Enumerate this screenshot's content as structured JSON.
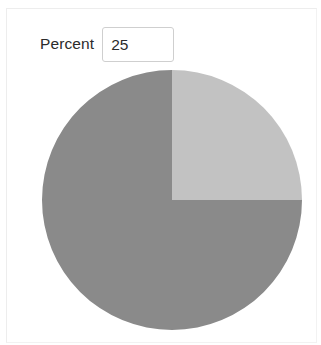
{
  "form": {
    "percent_label": "Percent",
    "percent_value": "25",
    "percent_placeholder": ""
  },
  "chart_data": {
    "type": "pie",
    "title": "",
    "labels": [
      "Percent",
      "Remainder"
    ],
    "values": [
      25,
      75
    ],
    "unit": "%",
    "total": 100,
    "start_angle_deg": 0,
    "direction": "clockwise",
    "colors": [
      "#c2c2c2",
      "#8a8a8a"
    ],
    "legend": "none",
    "center_x": 130,
    "center_y": 130,
    "radius": 130
  },
  "colors": {
    "slice_highlight": "#c2c2c2",
    "slice_remainder": "#8a8a8a",
    "text": "#2b2b2b",
    "input_border": "#cfcfcf",
    "background": "#ffffff",
    "frame_border": "#f2f2f2"
  }
}
